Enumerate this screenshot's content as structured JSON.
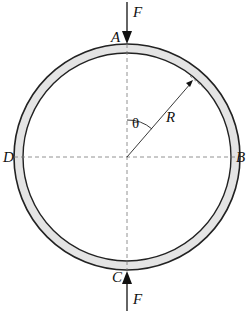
{
  "diagram": {
    "labels": {
      "top_force": "F",
      "bottom_force": "F",
      "point_top": "A",
      "point_right": "B",
      "point_bottom": "C",
      "point_left": "D",
      "radius": "R",
      "angle": "θ"
    },
    "colors": {
      "ring_fill": "#e4e4e4",
      "stroke": "#222222",
      "dash": "#777777"
    }
  }
}
